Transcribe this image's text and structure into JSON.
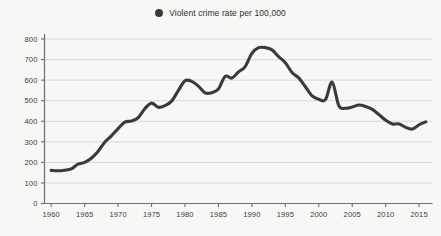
{
  "legend": {
    "label": "Violent crime rate per 100,000",
    "marker": "legend-dot-icon",
    "color": "#3a3a3a",
    "position": "top-center"
  },
  "colors": {
    "background": "#f7f7f5",
    "line": "#3a3a3a",
    "gridline": "#d8d8d8",
    "axis": "#6e6e6e",
    "text": "#3d3d3d"
  },
  "chart_data": {
    "type": "line",
    "title": "",
    "subtitle": "",
    "xlabel": "",
    "ylabel": "",
    "xlim": [
      1959,
      2017
    ],
    "ylim": [
      0,
      800
    ],
    "grid": true,
    "legend_position": "top-center",
    "xticks": [
      1960,
      1965,
      1970,
      1975,
      1980,
      1985,
      1990,
      1995,
      2000,
      2005,
      2010,
      2015
    ],
    "xtick_labels": [
      "1960",
      "1965",
      "1970",
      "1975",
      "1980",
      "1985",
      "1990",
      "1995",
      "2000",
      "2005",
      "2010",
      "2015"
    ],
    "yticks": [
      0,
      100,
      200,
      300,
      400,
      500,
      600,
      700,
      800
    ],
    "ytick_labels": [
      "0",
      "100",
      "200",
      "300",
      "400",
      "500",
      "600",
      "700",
      "800"
    ],
    "series": [
      {
        "name": "Violent crime rate per 100,000",
        "color": "#3a3a3a",
        "x": [
          1960,
          1961,
          1962,
          1963,
          1964,
          1965,
          1966,
          1967,
          1968,
          1969,
          1970,
          1971,
          1972,
          1973,
          1974,
          1975,
          1976,
          1977,
          1978,
          1979,
          1980,
          1981,
          1982,
          1983,
          1984,
          1985,
          1986,
          1987,
          1988,
          1989,
          1990,
          1991,
          1992,
          1993,
          1994,
          1995,
          1996,
          1997,
          1998,
          1999,
          2000,
          2001,
          2002,
          2003,
          2004,
          2005,
          2006,
          2007,
          2008,
          2009,
          2010,
          2011,
          2012,
          2013,
          2014,
          2015,
          2016
        ],
        "values": [
          161,
          159,
          162,
          168,
          191,
          200,
          220,
          253,
          298,
          329,
          364,
          396,
          401,
          417,
          461,
          488,
          468,
          476,
          498,
          549,
          597,
          594,
          571,
          538,
          539,
          557,
          618,
          610,
          640,
          666,
          730,
          758,
          758,
          747,
          714,
          685,
          637,
          611,
          568,
          523,
          507,
          505,
          590,
          475,
          463,
          469,
          479,
          472,
          458,
          432,
          405,
          387,
          387,
          370,
          362,
          383,
          397
        ]
      }
    ]
  }
}
